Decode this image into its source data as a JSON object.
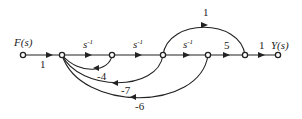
{
  "diagram": {
    "type": "signal-flow-graph",
    "input_label": "F(s)",
    "output_label": "Y(s)",
    "nodes": [
      {
        "id": "n1",
        "x": 23,
        "y": 55
      },
      {
        "id": "n2",
        "x": 62,
        "y": 55
      },
      {
        "id": "n3",
        "x": 112,
        "y": 55
      },
      {
        "id": "n4",
        "x": 163,
        "y": 55
      },
      {
        "id": "n5",
        "x": 208,
        "y": 55
      },
      {
        "id": "n6",
        "x": 245,
        "y": 55
      },
      {
        "id": "n7",
        "x": 278,
        "y": 55
      }
    ],
    "forward_edges": [
      {
        "from": "n1",
        "to": "n2",
        "gain": "1"
      },
      {
        "from": "n2",
        "to": "n3",
        "gain": "s",
        "exp": "-1"
      },
      {
        "from": "n3",
        "to": "n4",
        "gain": "s",
        "exp": "-1"
      },
      {
        "from": "n4",
        "to": "n5",
        "gain": "s",
        "exp": "-1"
      },
      {
        "from": "n5",
        "to": "n6",
        "gain": "5"
      },
      {
        "from": "n6",
        "to": "n7",
        "gain": "1"
      }
    ],
    "feedforward_edges": [
      {
        "from": "n4",
        "to": "n6",
        "gain": "1"
      }
    ],
    "feedback_edges": [
      {
        "from": "n3",
        "to": "n2",
        "gain": "-4"
      },
      {
        "from": "n4",
        "to": "n2",
        "gain": "-7"
      },
      {
        "from": "n5",
        "to": "n2",
        "gain": "-6"
      }
    ]
  }
}
